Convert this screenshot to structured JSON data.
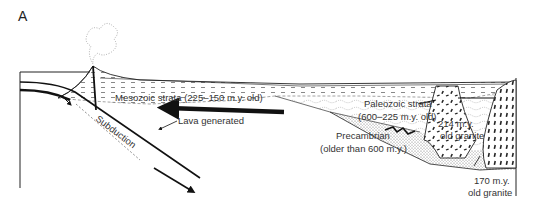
{
  "figure": {
    "panel_label": "A",
    "labels": {
      "mesozoic": "Mesozoic strata (225–150 m.y. old)",
      "paleozoic_1": "Paleozoic strata",
      "paleozoic_2": "(600–225 m.y. old)",
      "precambrian_1": "Precambrian",
      "precambrian_2": "(older than 600 m.y.)",
      "granite214_1": "214 m.y.",
      "granite214_2": "old granite",
      "granite170_1": "170 m.y.",
      "granite170_2": "old granite",
      "subduction": "Subduction",
      "lava": "Lava generated"
    },
    "icons": [
      "volcano-plume-icon",
      "plate-motion-arrow-icon",
      "subduction-arrow-icon"
    ],
    "colors": {
      "ink": "#1a1a1a",
      "background": "#ffffff",
      "stipple": "#555555"
    }
  }
}
